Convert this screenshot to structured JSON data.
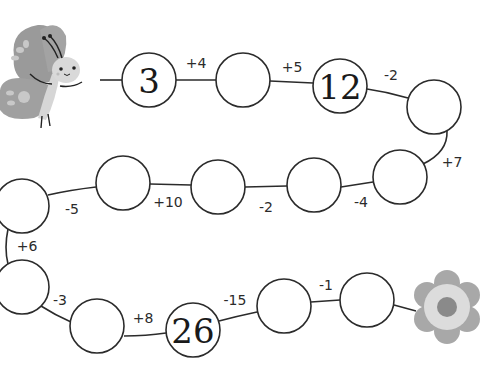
{
  "puzzle": {
    "type": "number-chain",
    "start_icon": "butterfly-icon",
    "end_icon": "flower-icon",
    "nodes": [
      {
        "id": 1,
        "value": "3",
        "cx": 149,
        "cy": 80
      },
      {
        "id": 2,
        "value": "",
        "cx": 243,
        "cy": 80
      },
      {
        "id": 3,
        "value": "12",
        "cx": 340,
        "cy": 86
      },
      {
        "id": 4,
        "value": "",
        "cx": 434,
        "cy": 107
      },
      {
        "id": 5,
        "value": "",
        "cx": 400,
        "cy": 177
      },
      {
        "id": 6,
        "value": "",
        "cx": 314,
        "cy": 185
      },
      {
        "id": 7,
        "value": "",
        "cx": 218,
        "cy": 187
      },
      {
        "id": 8,
        "value": "",
        "cx": 123,
        "cy": 183
      },
      {
        "id": 9,
        "value": "",
        "cx": 22,
        "cy": 206
      },
      {
        "id": 10,
        "value": "",
        "cx": 22,
        "cy": 287
      },
      {
        "id": 11,
        "value": "",
        "cx": 97,
        "cy": 326
      },
      {
        "id": 12,
        "value": "26",
        "cx": 193,
        "cy": 330
      },
      {
        "id": 13,
        "value": "",
        "cx": 284,
        "cy": 306
      },
      {
        "id": 14,
        "value": "",
        "cx": 367,
        "cy": 300
      }
    ],
    "operations": [
      {
        "from": 1,
        "to": 2,
        "label": "+4",
        "x": 196,
        "y": 63
      },
      {
        "from": 2,
        "to": 3,
        "label": "+5",
        "x": 292,
        "y": 67
      },
      {
        "from": 3,
        "to": 4,
        "label": "-2",
        "x": 391,
        "y": 75
      },
      {
        "from": 4,
        "to": 5,
        "label": "+7",
        "x": 452,
        "y": 162
      },
      {
        "from": 5,
        "to": 6,
        "label": "-4",
        "x": 361,
        "y": 202
      },
      {
        "from": 6,
        "to": 7,
        "label": "-2",
        "x": 266,
        "y": 207
      },
      {
        "from": 7,
        "to": 8,
        "label": "+10",
        "x": 168,
        "y": 202
      },
      {
        "from": 8,
        "to": 9,
        "label": "-5",
        "x": 72,
        "y": 209
      },
      {
        "from": 9,
        "to": 10,
        "label": "+6",
        "x": 27,
        "y": 246
      },
      {
        "from": 10,
        "to": 11,
        "label": "-3",
        "x": 60,
        "y": 300
      },
      {
        "from": 11,
        "to": 12,
        "label": "+8",
        "x": 143,
        "y": 318
      },
      {
        "from": 12,
        "to": 13,
        "label": "-15",
        "x": 235,
        "y": 300
      },
      {
        "from": 13,
        "to": 14,
        "label": "-1",
        "x": 326,
        "y": 285
      }
    ]
  },
  "colors": {
    "line": "#2b2b2b",
    "butterfly_wing": "#9a9a9a",
    "butterfly_wing_spots": "#c8c8c8",
    "butterfly_body": "#d6d6d6",
    "flower_petal": "#a8a8a8",
    "flower_ring": "#dcdcdc",
    "flower_center": "#8a8a8a"
  }
}
